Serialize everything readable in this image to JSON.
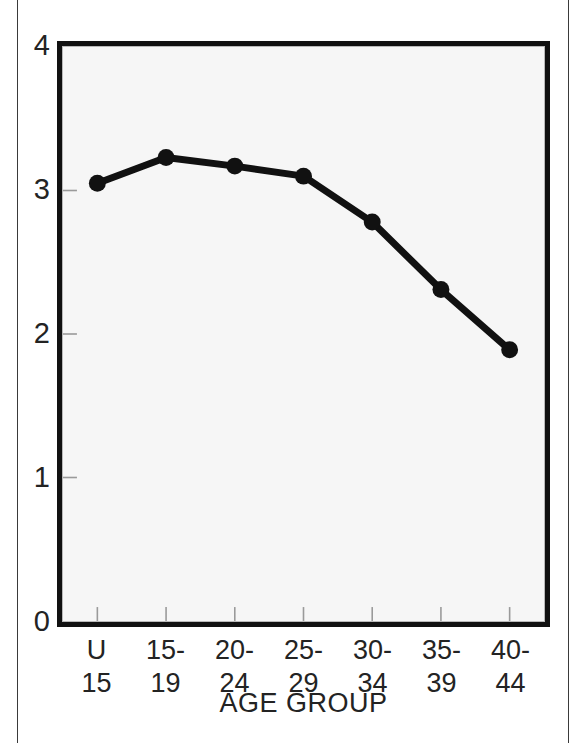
{
  "figure": {
    "background_color": "#ffffff",
    "plot_fill_color": "#f6f6f6",
    "frame_color": "#111111",
    "series_color": "#111111"
  },
  "axes": {
    "y_ticks": [
      "4",
      "3",
      "2",
      "1",
      "0"
    ],
    "x_title": "AGE GROUP",
    "x_tick_lines": [
      {
        "line1": "U",
        "line2": "15"
      },
      {
        "line1": "15-",
        "line2": "19"
      },
      {
        "line1": "20-",
        "line2": "24"
      },
      {
        "line1": "25-",
        "line2": "29"
      },
      {
        "line1": "30-",
        "line2": "34"
      },
      {
        "line1": "35-",
        "line2": "39"
      },
      {
        "line1": "40-",
        "line2": "44"
      }
    ]
  },
  "chart_data": {
    "type": "line",
    "title": "",
    "xlabel": "AGE GROUP",
    "ylabel": "",
    "categories": [
      "U 15",
      "15-19",
      "20-24",
      "25-29",
      "30-34",
      "35-39",
      "40-44"
    ],
    "values": [
      3.05,
      3.23,
      3.17,
      3.1,
      2.78,
      2.31,
      1.89
    ],
    "ylim": [
      0,
      4
    ],
    "yticks": [
      0,
      1,
      2,
      3,
      4
    ],
    "grid": false,
    "legend": null,
    "marker": "filled-circle",
    "series": [
      {
        "name": "value",
        "values": [
          3.05,
          3.23,
          3.17,
          3.1,
          2.78,
          2.31,
          1.89
        ]
      }
    ]
  }
}
